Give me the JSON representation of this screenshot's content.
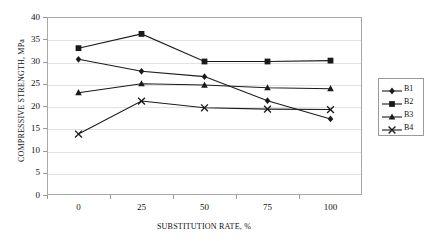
{
  "chart_data": {
    "type": "line",
    "title": "",
    "xlabel": "SUBSTITUTION RATE, %",
    "ylabel": "COMPRESSIVE STRENGTH, MPa",
    "categories": [
      "0",
      "25",
      "50",
      "75",
      "100"
    ],
    "x": [
      0,
      25,
      50,
      75,
      100
    ],
    "ylim": [
      0,
      40
    ],
    "yticks": [
      "0",
      "5",
      "10",
      "15",
      "20",
      "25",
      "30",
      "35",
      "40"
    ],
    "ytick_values": [
      0,
      5,
      10,
      15,
      20,
      25,
      30,
      35,
      40
    ],
    "grid": true,
    "legend_position": "right",
    "series": [
      {
        "name": "B1",
        "marker": "diamond",
        "color": "#1a1a1a",
        "values": [
          30.5,
          27.8,
          26.6,
          21.2,
          17.1
        ]
      },
      {
        "name": "B2",
        "marker": "square",
        "color": "#1a1a1a",
        "values": [
          33.0,
          36.2,
          30.0,
          30.0,
          30.2
        ]
      },
      {
        "name": "B3",
        "marker": "triangle",
        "color": "#1a1a1a",
        "values": [
          23.0,
          25.0,
          24.7,
          24.1,
          23.9
        ]
      },
      {
        "name": "B4",
        "marker": "cross",
        "color": "#1a1a1a",
        "values": [
          13.7,
          21.1,
          19.6,
          19.3,
          19.2
        ]
      }
    ]
  },
  "legend": {
    "entries": [
      {
        "label": "B1"
      },
      {
        "label": "B2"
      },
      {
        "label": "B3"
      },
      {
        "label": "B4"
      }
    ]
  },
  "colors": {
    "series_line": "#1a1a1a",
    "gridline": "#e2e2e2",
    "frame": "#a8a8a8",
    "background": "#ffffff"
  }
}
